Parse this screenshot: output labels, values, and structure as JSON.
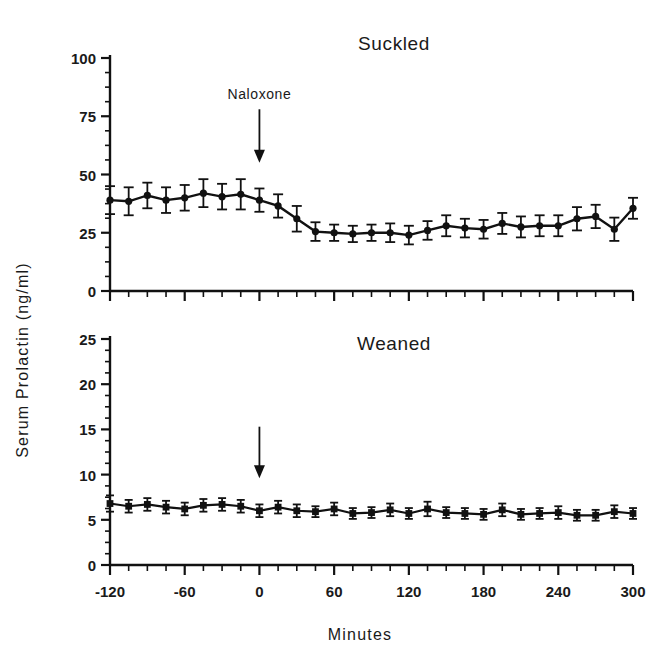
{
  "figure": {
    "background_color": "#ffffff",
    "ink_color": "#111111",
    "y_axis_label": "Serum  Prolactin   (ng/ml)",
    "x_axis_label": "Minutes"
  },
  "chart_data": [
    {
      "type": "line",
      "title": "Suckled",
      "xlabel": "Minutes",
      "ylabel": "Serum Prolactin (ng/ml)",
      "xlim": [
        -120,
        300
      ],
      "ylim": [
        0,
        100
      ],
      "xticks": [
        -120,
        -60,
        0,
        60,
        120,
        180,
        240,
        300
      ],
      "xtick_labels": [
        "-120",
        "-60",
        "0",
        "60",
        "120",
        "180",
        "240",
        "300"
      ],
      "minor_xtick_interval": 15,
      "yticks": [
        0,
        25,
        50,
        75,
        100
      ],
      "ytick_labels": [
        "0",
        "25",
        "50",
        "75",
        "100"
      ],
      "minor_ytick_interval": 6.25,
      "grid": false,
      "legend": "none",
      "marker": "filled-circle",
      "errorbars": "SEM",
      "annotations": [
        {
          "text": "Naloxone",
          "x": 0,
          "arrow_from_y": 78,
          "arrow_to_y": 55
        }
      ],
      "x": [
        -120,
        -105,
        -90,
        -75,
        -60,
        -45,
        -30,
        -15,
        0,
        15,
        30,
        45,
        60,
        75,
        90,
        105,
        120,
        135,
        150,
        165,
        180,
        195,
        210,
        225,
        240,
        255,
        270,
        285,
        300
      ],
      "values": [
        39,
        38.5,
        41,
        39,
        40,
        42,
        40.5,
        41.5,
        39,
        36.5,
        31,
        25.5,
        25,
        24.5,
        25,
        25,
        24,
        26,
        28,
        27,
        26.5,
        29,
        27.5,
        28,
        28,
        31,
        32,
        26.5,
        35.5
      ],
      "errors": [
        6,
        6,
        5.5,
        5.5,
        5.5,
        6,
        5.5,
        6.5,
        5,
        5,
        5.5,
        4,
        3.5,
        3.5,
        3.5,
        4,
        4,
        4,
        4.5,
        4,
        4,
        4.5,
        4.5,
        4.5,
        4.5,
        5,
        5,
        5,
        4.5
      ]
    },
    {
      "type": "line",
      "title": "Weaned",
      "xlabel": "Minutes",
      "ylabel": "Serum Prolactin (ng/ml)",
      "xlim": [
        -120,
        300
      ],
      "ylim": [
        0,
        25
      ],
      "xticks": [
        -120,
        -60,
        0,
        60,
        120,
        180,
        240,
        300
      ],
      "xtick_labels": [
        "-120",
        "-60",
        "0",
        "60",
        "120",
        "180",
        "240",
        "300"
      ],
      "minor_xtick_interval": 15,
      "yticks": [
        0,
        5,
        10,
        15,
        20,
        25
      ],
      "ytick_labels": [
        "0",
        "5",
        "10",
        "15",
        "20",
        "25"
      ],
      "minor_ytick_interval": 1.25,
      "grid": false,
      "legend": "none",
      "marker": "filled-square",
      "errorbars": "SEM",
      "annotations": [
        {
          "text": "",
          "x": 0,
          "arrow_from_y": 15.3,
          "arrow_to_y": 9.6
        }
      ],
      "x": [
        -120,
        -105,
        -90,
        -75,
        -60,
        -45,
        -30,
        -15,
        0,
        15,
        30,
        45,
        60,
        75,
        90,
        105,
        120,
        135,
        150,
        165,
        180,
        195,
        210,
        225,
        240,
        255,
        270,
        285,
        300
      ],
      "values": [
        6.8,
        6.5,
        6.7,
        6.4,
        6.2,
        6.6,
        6.7,
        6.5,
        6.0,
        6.4,
        6.0,
        5.9,
        6.2,
        5.7,
        5.8,
        6.1,
        5.7,
        6.2,
        5.8,
        5.7,
        5.6,
        6.1,
        5.6,
        5.7,
        5.8,
        5.5,
        5.5,
        5.9,
        5.7
      ],
      "errors": [
        0.9,
        0.7,
        0.7,
        0.7,
        0.7,
        0.7,
        0.7,
        0.7,
        0.7,
        0.7,
        0.7,
        0.6,
        0.7,
        0.6,
        0.6,
        0.7,
        0.6,
        0.8,
        0.6,
        0.6,
        0.6,
        0.7,
        0.6,
        0.6,
        0.7,
        0.6,
        0.6,
        0.7,
        0.6
      ]
    }
  ]
}
